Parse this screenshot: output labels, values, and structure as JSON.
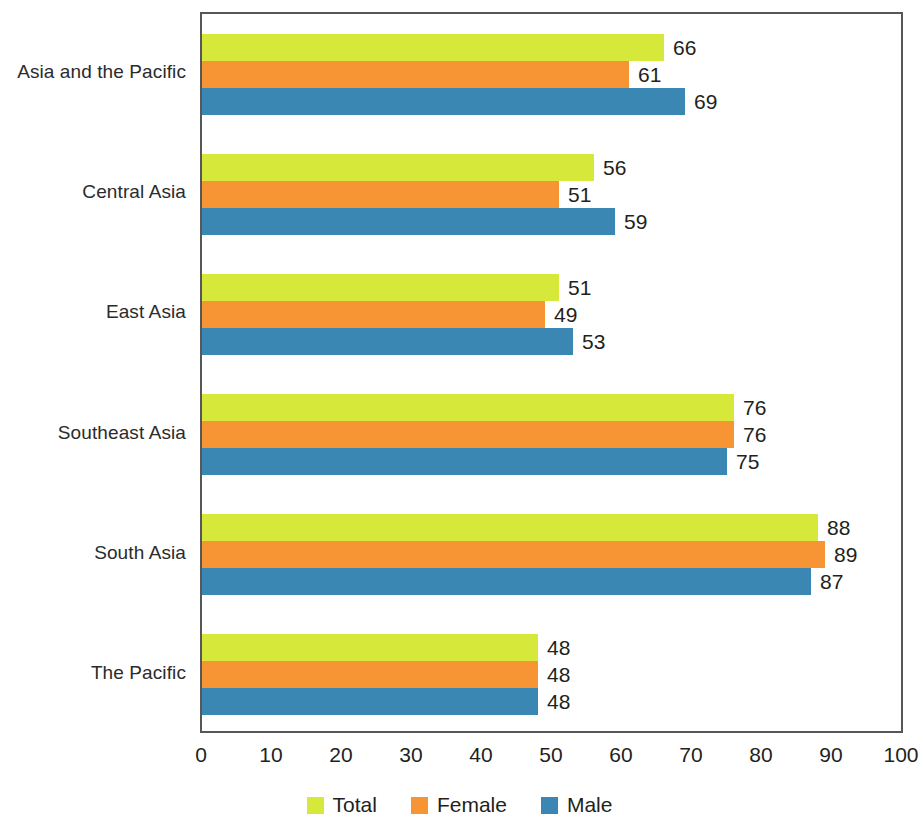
{
  "chart_data": {
    "type": "bar",
    "orientation": "horizontal",
    "title": "",
    "subtitle": "",
    "xlabel": "",
    "ylabel": "",
    "xlim": [
      0,
      100
    ],
    "xticks": [
      0,
      10,
      20,
      30,
      40,
      50,
      60,
      70,
      80,
      90,
      100
    ],
    "xtick_labels": [
      "0",
      "10",
      "20",
      "30",
      "40",
      "50",
      "60",
      "70",
      "80",
      "90",
      "100"
    ],
    "grid": false,
    "legend_position": "bottom",
    "categories": [
      "Asia and the Pacific",
      "Central Asia",
      "East Asia",
      "Southeast Asia",
      "South Asia",
      "The Pacific"
    ],
    "series": [
      {
        "name": "Total",
        "color": "#d6e83a",
        "values": [
          66,
          56,
          51,
          76,
          88,
          48
        ],
        "labels": [
          "66",
          "56",
          "51",
          "76",
          "88",
          "48"
        ]
      },
      {
        "name": "Female",
        "color": "#f79433",
        "values": [
          61,
          51,
          49,
          76,
          89,
          48
        ],
        "labels": [
          "61",
          "51",
          "49",
          "76",
          "89",
          "48"
        ]
      },
      {
        "name": "Male",
        "color": "#3b87b4",
        "values": [
          69,
          59,
          53,
          75,
          87,
          48
        ],
        "labels": [
          "69",
          "59",
          "53",
          "75",
          "87",
          "48"
        ]
      }
    ]
  },
  "legend": {
    "items": [
      {
        "label": "Total",
        "color": "#d6e83a"
      },
      {
        "label": "Female",
        "color": "#f79433"
      },
      {
        "label": "Male",
        "color": "#3b87b4"
      }
    ]
  }
}
